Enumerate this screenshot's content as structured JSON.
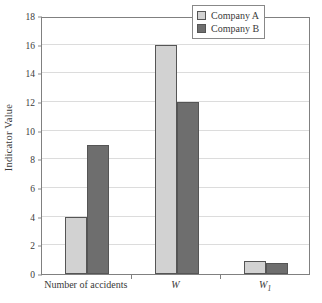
{
  "chart_data": {
    "type": "bar",
    "title": "",
    "subtitle": "",
    "xlabel": "",
    "ylabel": "Indicator Value",
    "categories": [
      "Number of accidents",
      "W",
      "W1"
    ],
    "category_labels_display": [
      "Number of accidents",
      "W",
      "W₁"
    ],
    "series": [
      {
        "name": "Company A",
        "color": "#d2d2d2",
        "values": [
          4,
          16,
          0.9
        ]
      },
      {
        "name": "Company B",
        "color": "#6e6e6e",
        "values": [
          9,
          12,
          0.8
        ]
      }
    ],
    "ylim": [
      0,
      18
    ],
    "ytick_values": [
      0,
      2,
      4,
      6,
      8,
      10,
      12,
      14,
      16,
      18
    ],
    "ytick_labels": [
      "0",
      "2",
      "4",
      "6",
      "8",
      "10",
      "12",
      "14",
      "16",
      "18"
    ],
    "grid": "horizontal",
    "legend_position": "top-right",
    "frame": true
  },
  "legend": {
    "entries": [
      {
        "label": "Company A",
        "swatch": "legend-swatch-company-a"
      },
      {
        "label": "Company B",
        "swatch": "legend-swatch-company-b"
      }
    ]
  }
}
